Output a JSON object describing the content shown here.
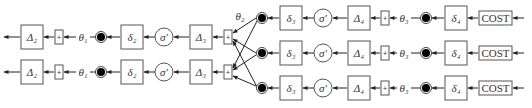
{
  "diagram": {
    "labels": {
      "Delta2": "Δ₂",
      "Delta3": "Δ₃",
      "Delta4": "Δ₄",
      "delta2": "δ₂",
      "delta3": "δ₃",
      "delta4": "δ₄",
      "sigma_prime": "σ′",
      "theta1": "θ₁",
      "theta2": "θ₂",
      "theta3": "θ₃",
      "plus": "+",
      "cost": "COST"
    },
    "rows_layer2": [
      {
        "Delta": "Δ₂",
        "plus": "+",
        "theta": "θ₁",
        "delta": "δ₂",
        "sigma": "σ′",
        "Delta_next": "Δ₃",
        "plus2": "+"
      },
      {
        "Delta": "Δ₂",
        "plus": "+",
        "theta": "θ₁",
        "delta": "δ₂",
        "sigma": "σ′",
        "Delta_next": "Δ₃",
        "plus2": "+"
      }
    ],
    "rows_layer3": [
      {
        "delta": "δ₃",
        "sigma": "σ′",
        "Delta": "Δ₄",
        "plus": "+",
        "theta": "θ₃",
        "delta_out": "δ₄",
        "cost": "COST"
      },
      {
        "delta": "δ₃",
        "sigma": "σ′",
        "Delta": "Δ₄",
        "plus": "+",
        "theta": "θ₃",
        "delta_out": "δ₄",
        "cost": "COST"
      },
      {
        "delta": "δ₃",
        "sigma": "σ′",
        "Delta": "Δ₄",
        "plus": "+",
        "theta": "θ₃",
        "delta_out": "δ₄",
        "cost": "COST"
      }
    ],
    "cross_label": "θ₂",
    "colors": {
      "stroke": "#555555",
      "line": "#222222",
      "node_fill": "#000000",
      "background": "#ffffff"
    }
  }
}
